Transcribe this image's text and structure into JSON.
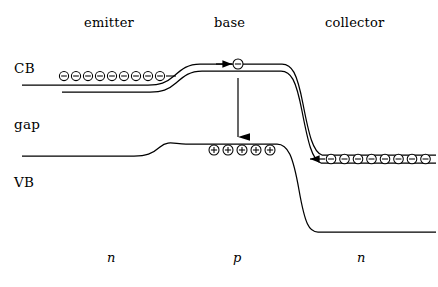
{
  "figure": {
    "background_color": "#ffffff",
    "line_color": "#000000",
    "width": 438,
    "height": 287
  },
  "region_labels": [
    {
      "text": "emitter",
      "x": 84,
      "y": 16
    },
    {
      "text": "base",
      "x": 214,
      "y": 16
    },
    {
      "text": "collector",
      "x": 325,
      "y": 16
    }
  ],
  "band_labels": [
    {
      "text": "CB",
      "x": 14,
      "y": 62
    },
    {
      "text": "gap",
      "x": 14,
      "y": 118
    },
    {
      "text": "VB",
      "x": 14,
      "y": 176
    }
  ],
  "doping_labels": [
    {
      "text": "n",
      "x": 107,
      "y": 251
    },
    {
      "text": "p",
      "x": 233,
      "y": 251
    },
    {
      "text": "n",
      "x": 357,
      "y": 251
    }
  ],
  "bands": {
    "conduction_band": {
      "name": "CB",
      "outer_path": "M 22 85 L 148 85 C 160 85 166 83 174 76 C 182 69 188 64 200 64 L 282 64 C 292 64 297 73 303 104 C 309 135 313 152 322 155 L 436 155",
      "inner_path": "M 62 92 L 150 92 C 162 92 168 90 176 83 C 184 76 190 71 202 71 L 281 71 C 291 71 296 80 302 111 C 308 142 312 160 321 163 L 436 163"
    },
    "valence_band": {
      "name": "VB",
      "outer_path": "M 22 156 L 134 156 C 146 156 152 154 160 147 C 168 140 174 144 186 144 L 277 144 C 288 144 293 156 299 190 C 305 224 309 232 318 232 L 436 232"
    }
  },
  "carriers": {
    "emitter_electrons": {
      "symbol": "electron",
      "count": 9,
      "x_start": 64,
      "x_step": 12,
      "y": 76,
      "radius": 4.6
    },
    "base_electron": {
      "symbol": "electron",
      "count": 1,
      "x_start": 238,
      "x_step": 0,
      "y": 64,
      "radius": 5.0
    },
    "base_holes": {
      "symbol": "hole",
      "count": 5,
      "x_start": 214,
      "x_step": 14,
      "y": 150,
      "radius": 5.0
    },
    "collector_electrons": {
      "symbol": "electron",
      "count": 8,
      "x_start": 331,
      "x_step": 13.5,
      "y": 159,
      "radius": 4.8
    }
  },
  "arrows": {
    "injection_arrow": {
      "name": "electron-injection-arrow",
      "direction": "right",
      "x1": 216,
      "y1": 64,
      "x2": 232,
      "y2": 64
    },
    "recombination_arrow": {
      "name": "recombination-arrow",
      "direction": "down",
      "x1": 238,
      "y1": 78,
      "x2": 238,
      "y2": 137
    },
    "collection_arrow": {
      "name": "electron-collection-arrow",
      "direction": "left",
      "x1": 325,
      "y1": 159,
      "x2": 310,
      "y2": 159
    },
    "emitter_tail": {
      "name": "emitter-electron-tail",
      "direction": "right",
      "x1": 172,
      "y1": 76,
      "x2": 172,
      "y2": 76
    }
  }
}
